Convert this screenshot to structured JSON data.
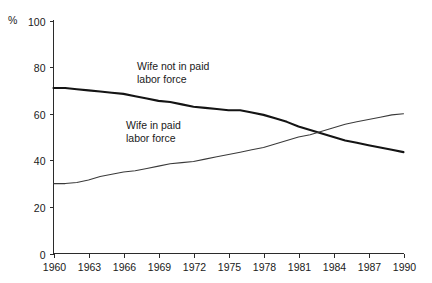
{
  "chart_data": {
    "type": "line",
    "title": "",
    "subtitle": "",
    "xlabel": "",
    "ylabel": "",
    "y_unit_label": "%",
    "xlim": [
      1960,
      1990
    ],
    "ylim": [
      0,
      100
    ],
    "grid": false,
    "legend_position": "inline-annotation",
    "x_tick_labels": [
      "1960",
      "1963",
      "1966",
      "1969",
      "1972",
      "1975",
      "1978",
      "1981",
      "1984",
      "1987",
      "1990"
    ],
    "x_ticks": [
      1960,
      1963,
      1966,
      1969,
      1972,
      1975,
      1978,
      1981,
      1984,
      1987,
      1990
    ],
    "y_tick_labels": [
      "0",
      "20",
      "40",
      "60",
      "80",
      "100"
    ],
    "y_ticks": [
      0,
      20,
      40,
      60,
      80,
      100
    ],
    "x": [
      1960,
      1961,
      1962,
      1963,
      1964,
      1965,
      1966,
      1967,
      1968,
      1969,
      1970,
      1971,
      1972,
      1973,
      1974,
      1975,
      1976,
      1977,
      1978,
      1979,
      1980,
      1981,
      1982,
      1983,
      1984,
      1985,
      1986,
      1987,
      1988,
      1989,
      1990
    ],
    "series": [
      {
        "name": "Wife not in paid labor force",
        "style": "thick",
        "color": "#141414",
        "annotation": "Wife not in paid\nlabor force",
        "values": [
          71,
          71,
          70.5,
          70,
          69.5,
          69,
          68.5,
          67.5,
          66.5,
          65.5,
          65,
          64,
          63,
          62.5,
          62,
          61.5,
          61.5,
          60.5,
          59.5,
          58,
          56.5,
          54.5,
          53,
          51.5,
          50,
          48.5,
          47.5,
          46.5,
          45.5,
          44.5,
          43.5
        ]
      },
      {
        "name": "Wife in paid labor force",
        "style": "thin",
        "color": "#3a3a3a",
        "annotation": "Wife in paid\nlabor force",
        "values": [
          30,
          30,
          30.5,
          31.5,
          33,
          34,
          35,
          35.5,
          36.5,
          37.5,
          38.5,
          39,
          39.5,
          40.5,
          41.5,
          42.5,
          43.5,
          44.5,
          45.5,
          47,
          48.5,
          50,
          51,
          52.5,
          54,
          55.5,
          56.5,
          57.5,
          58.5,
          59.5,
          60
        ]
      }
    ],
    "annotations": [
      {
        "id": "annotation-wife-not-in-paid-labor-force",
        "line1": "Wife not in paid",
        "line2": "labor force",
        "x_px": 137,
        "y_px": 70
      },
      {
        "id": "annotation-wife-in-paid-labor-force",
        "line1": "Wife in paid",
        "line2": "labor force",
        "x_px": 126,
        "y_px": 129
      }
    ],
    "colors": {
      "background": "#ffffff",
      "axis": "#2b2b2b",
      "text": "#1a1a1a",
      "series_thick": "#141414",
      "series_thin": "#3a3a3a"
    }
  }
}
